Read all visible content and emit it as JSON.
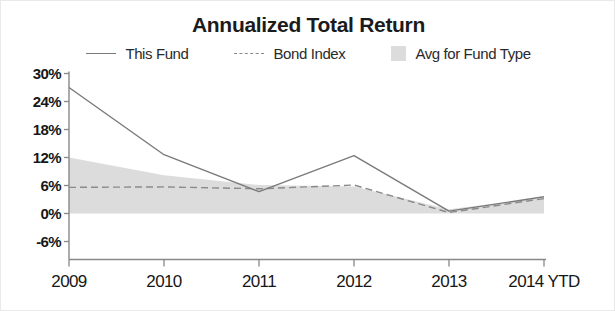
{
  "chart_data": {
    "type": "line",
    "title": "Annualized Total Return",
    "xlabel": "",
    "ylabel": "",
    "categories": [
      "2009",
      "2010",
      "2011",
      "2012",
      "2013",
      "2014 YTD"
    ],
    "ytick_labels": [
      "30%",
      "24%",
      "18%",
      "12%",
      "6%",
      "0%",
      "-6%"
    ],
    "ytick_values": [
      30,
      24,
      18,
      12,
      6,
      0,
      -6
    ],
    "ylim": [
      -6,
      30
    ],
    "grid": false,
    "legend_position": "top-center",
    "series": [
      {
        "name": "This Fund",
        "style": "solid-line",
        "color": "#7a7a7a",
        "values": [
          27.0,
          12.6,
          4.7,
          12.4,
          0.5,
          3.6
        ]
      },
      {
        "name": "Bond Index",
        "style": "dashed-line",
        "color": "#8a8a8a",
        "values": [
          5.6,
          5.7,
          5.3,
          6.1,
          0.2,
          3.2
        ]
      },
      {
        "name": "Avg for Fund Type",
        "style": "shaded-band",
        "color": "#dcdcdc",
        "band_upper": [
          12.0,
          8.2,
          6.1,
          5.8,
          0.9,
          3.4
        ],
        "band_lower": [
          0.0,
          0.0,
          0.0,
          0.0,
          0.0,
          0.0
        ]
      }
    ]
  },
  "legend": {
    "items": [
      {
        "label": "This Fund"
      },
      {
        "label": "Bond Index"
      },
      {
        "label": "Avg for Fund Type"
      }
    ]
  },
  "colors": {
    "background": "#ffffff",
    "axis": "#888888",
    "text": "#171717",
    "this_fund": "#7a7a7a",
    "bond_index": "#8a8a8a",
    "avg_band": "#dcdcdc"
  }
}
